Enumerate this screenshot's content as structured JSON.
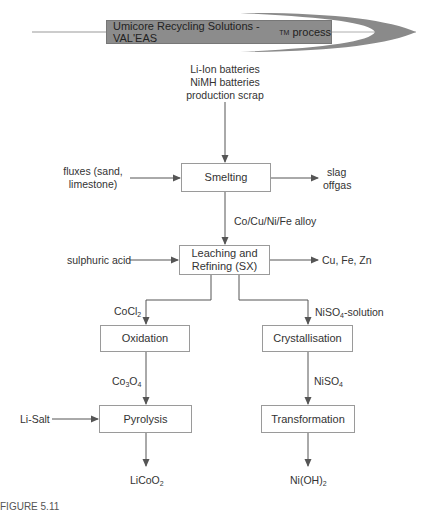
{
  "banner": {
    "title": "Umicore Recycling Solutions - VAL'EAS",
    "trademark": "TM",
    "suffix": " process",
    "fill_color": "#8c8c8c",
    "swoosh_color": "#8a8a8a"
  },
  "inputs": {
    "feed_line1": "Li-Ion batteries",
    "feed_line2": "NiMH batteries",
    "feed_line3": "production scrap",
    "fluxes_line1": "fluxes (sand,",
    "fluxes_line2": "limestone)",
    "acid": "sulphuric acid",
    "li_salt": "Li-Salt"
  },
  "boxes": {
    "smelting": "Smelting",
    "leaching_line1": "Leaching and",
    "leaching_line2": "Refining (SX)",
    "oxidation": "Oxidation",
    "crystallisation": "Crystallisation",
    "pyrolysis": "Pyrolysis",
    "transformation": "Transformation"
  },
  "outputs": {
    "slag": "slag",
    "offgas": "offgas",
    "metals": "Cu, Fe, Zn"
  },
  "streams": {
    "alloy": "Co/Cu/Ni/Fe alloy",
    "cocl2_base": "CoCl",
    "cocl2_sub": "2",
    "niso4sol_base": "NiSO",
    "niso4sol_sub": "4",
    "niso4sol_suffix": "-solution",
    "co3o4_a": "Co",
    "co3o4_sub1": "3",
    "co3o4_b": "O",
    "co3o4_sub2": "4",
    "niso4_base": "NiSO",
    "niso4_sub": "4"
  },
  "products": {
    "licoo2_base": "LiCoO",
    "licoo2_sub": "2",
    "nioh2_base": "Ni(OH)",
    "nioh2_sub": "2"
  },
  "caption": {
    "partial": "FIGURE 5.11"
  },
  "colors": {
    "line": "#555555",
    "box_border": "#9a9a9a"
  }
}
